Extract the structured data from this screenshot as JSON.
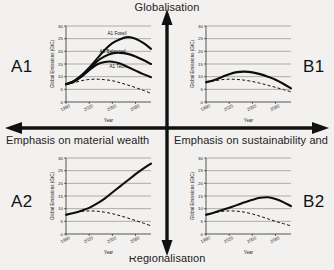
{
  "diagram": {
    "vertical_axis": {
      "top_label": "Globalisation",
      "bottom_label": "Regionalisation"
    },
    "horizontal_axis": {
      "left_label": "Emphasis on material wealth",
      "right_label": "Emphasis on sustainability and"
    },
    "quadrants": [
      {
        "id": "A1",
        "label": "A1",
        "position": "top-left"
      },
      {
        "id": "B1",
        "label": "B1",
        "position": "top-right"
      },
      {
        "id": "A2",
        "label": "A2",
        "position": "bottom-left"
      },
      {
        "id": "B2",
        "label": "B2",
        "position": "bottom-right"
      }
    ]
  },
  "axes_common": {
    "xlabel": "Year",
    "ylabel": "Global Emissions (GtC)",
    "xticks": [
      "1990",
      "2020",
      "2050",
      "2080"
    ],
    "yticks": [
      "0",
      "5",
      "10",
      "15",
      "20",
      "25",
      "30"
    ],
    "xlim": [
      1990,
      2100
    ],
    "ylim": [
      0,
      30
    ]
  },
  "chart_data": [
    {
      "id": "A1",
      "type": "line",
      "title": "A1",
      "xlabel": "Year",
      "ylabel": "Global Emissions (GtC)",
      "xlim": [
        1990,
        2100
      ],
      "ylim": [
        0,
        30
      ],
      "xticks": [
        1990,
        2020,
        2050,
        2080
      ],
      "yticks": [
        0,
        5,
        10,
        15,
        20,
        25,
        30
      ],
      "grid": true,
      "legend": "inline-annotations",
      "x": [
        1990,
        2000,
        2010,
        2020,
        2030,
        2040,
        2050,
        2060,
        2070,
        2080,
        2090,
        2100
      ],
      "series": [
        {
          "name": "A1 Fossil",
          "style": "solid",
          "annotation": "A1 Fossil",
          "values": [
            7,
            8.2,
            10.5,
            13.5,
            17,
            20.5,
            23.2,
            24.8,
            25.6,
            25.0,
            23.3,
            21.0
          ]
        },
        {
          "name": "A1 Balanced",
          "style": "solid",
          "annotation": "A1 Balanced",
          "values": [
            7,
            8.1,
            10.2,
            13.0,
            16.0,
            18.0,
            19.2,
            19.4,
            19.0,
            18.0,
            16.6,
            15.0
          ]
        },
        {
          "name": "A1 Tech",
          "style": "solid",
          "annotation": "A1 Tech",
          "values": [
            7,
            8.0,
            10.0,
            12.6,
            14.8,
            15.8,
            15.9,
            15.2,
            13.8,
            12.4,
            11.0,
            9.8
          ]
        },
        {
          "name": "A1 Dashed",
          "style": "dashed",
          "annotation": "",
          "values": [
            7,
            7.6,
            8.4,
            8.9,
            9.0,
            8.8,
            8.4,
            7.6,
            6.7,
            5.7,
            4.6,
            3.4
          ]
        }
      ]
    },
    {
      "id": "B1",
      "type": "line",
      "title": "B1",
      "xlabel": "Year",
      "ylabel": "Global Emissions (GtC)",
      "xlim": [
        1990,
        2100
      ],
      "ylim": [
        0,
        30
      ],
      "xticks": [
        1990,
        2020,
        2050,
        2080
      ],
      "yticks": [
        0,
        5,
        10,
        15,
        20,
        25,
        30
      ],
      "grid": true,
      "x": [
        1990,
        2000,
        2010,
        2020,
        2030,
        2040,
        2050,
        2060,
        2070,
        2080,
        2090,
        2100
      ],
      "series": [
        {
          "name": "B1 Solid",
          "style": "solid",
          "values": [
            7.8,
            8.6,
            9.8,
            11.0,
            11.8,
            12.0,
            11.7,
            11.0,
            10.0,
            8.8,
            7.2,
            5.4
          ]
        },
        {
          "name": "B1 Dashed",
          "style": "dashed",
          "values": [
            7.8,
            8.3,
            8.8,
            9.0,
            8.9,
            8.6,
            8.1,
            7.4,
            6.6,
            5.8,
            4.9,
            4.0
          ]
        }
      ]
    },
    {
      "id": "A2",
      "type": "line",
      "title": "A2",
      "xlabel": "Year",
      "ylabel": "Global Emissions (GtC)",
      "xlim": [
        1990,
        2100
      ],
      "ylim": [
        0,
        30
      ],
      "xticks": [
        1990,
        2020,
        2050,
        2080
      ],
      "yticks": [
        0,
        5,
        10,
        15,
        20,
        25,
        30
      ],
      "grid": true,
      "x": [
        1990,
        2000,
        2010,
        2020,
        2030,
        2040,
        2050,
        2060,
        2070,
        2080,
        2090,
        2100
      ],
      "series": [
        {
          "name": "A2 Solid",
          "style": "solid",
          "values": [
            7.6,
            8.3,
            9.2,
            10.3,
            12.0,
            14.0,
            16.4,
            18.8,
            21.2,
            23.6,
            25.8,
            27.8
          ]
        },
        {
          "name": "A2 Dashed",
          "style": "dashed",
          "values": [
            7.6,
            8.3,
            8.9,
            9.1,
            9.0,
            8.6,
            8.0,
            7.2,
            6.3,
            5.3,
            4.3,
            3.2
          ]
        }
      ]
    },
    {
      "id": "B2",
      "type": "line",
      "title": "B2",
      "xlabel": "Year",
      "ylabel": "Global Emissions (GtC)",
      "xlim": [
        1990,
        2100
      ],
      "ylim": [
        0,
        30
      ],
      "xticks": [
        1990,
        2020,
        2050,
        2080
      ],
      "yticks": [
        0,
        5,
        10,
        15,
        20,
        25,
        30
      ],
      "grid": true,
      "x": [
        1990,
        2000,
        2010,
        2020,
        2030,
        2040,
        2050,
        2060,
        2070,
        2080,
        2090,
        2100
      ],
      "series": [
        {
          "name": "B2 Solid",
          "style": "solid",
          "values": [
            7.6,
            8.4,
            9.4,
            10.4,
            11.4,
            12.5,
            13.5,
            14.3,
            14.5,
            13.8,
            12.6,
            11.0
          ]
        },
        {
          "name": "B2 Dashed",
          "style": "dashed",
          "values": [
            7.6,
            8.3,
            8.9,
            9.1,
            9.0,
            8.6,
            7.9,
            7.0,
            6.0,
            5.0,
            4.1,
            3.2
          ]
        }
      ]
    }
  ],
  "colors": {
    "ink": "#0d0d0d",
    "grid": "#555555",
    "background": "#f2f1ef"
  }
}
